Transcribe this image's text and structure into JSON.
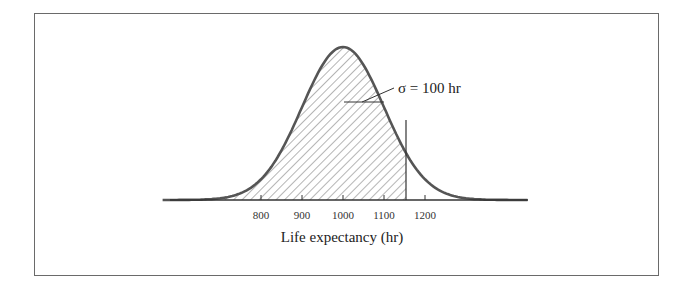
{
  "chart_data": {
    "type": "area",
    "title": "",
    "distribution": {
      "mean": 1000,
      "sigma": 100
    },
    "xlabel": "Life expectancy (hr)",
    "ylabel": "",
    "x_ticks": [
      800,
      900,
      1000,
      1100,
      1200
    ],
    "x_tick_labels": [
      "800",
      "900",
      "1000",
      "1100",
      "1200"
    ],
    "xlim": [
      610,
      1420
    ],
    "shaded_region": {
      "from": "-inf",
      "to": 1155,
      "pattern": "diagonal-hatch"
    },
    "cutoff_line_x": 1155,
    "annotations": [
      {
        "text": "σ = 100 hr",
        "points_to": "curve width at one standard deviation"
      }
    ],
    "grid": false,
    "legend": null
  },
  "labels": {
    "sigma_annotation": "σ = 100 hr",
    "axis_title": "Life expectancy (hr)",
    "ticks": [
      "800",
      "900",
      "1000",
      "1100",
      "1200"
    ]
  },
  "colors": {
    "curve": "#555555",
    "hatch": "#777777",
    "axis": "#333333",
    "frame": "#6a6a6a"
  }
}
